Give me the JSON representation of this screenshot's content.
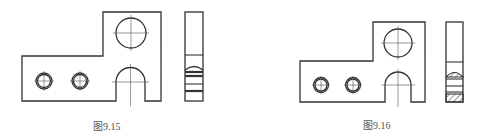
{
  "figures": [
    {
      "id": "fig-9-15",
      "caption": "图9.15",
      "front_view": "L-shaped plate with one large hole, two small holes and a U-slot",
      "side_view": "section without hatching, horizontal band lines"
    },
    {
      "id": "fig-9-16",
      "caption": "图9.16",
      "front_view": "L-shaped plate with one large hole, two small holes and a U-slot",
      "side_view": "section with hatched (cut) regions"
    }
  ],
  "colors": {
    "line": "#333333",
    "centerline": "#555555",
    "caption": "#555555",
    "background": "#ffffff"
  }
}
